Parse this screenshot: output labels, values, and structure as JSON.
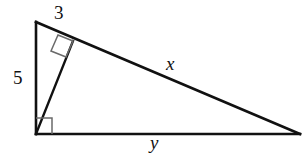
{
  "figure": {
    "background_color": "#ffffff",
    "stroke_color": "#111111",
    "marker_color": "#555555",
    "labels": {
      "short_leg": "3",
      "vertical_leg": "5",
      "hypotenuse": "x",
      "base": "y"
    },
    "vertices": {
      "apex": {
        "x": 36,
        "y": 22
      },
      "right_angle_corner": {
        "x": 36,
        "y": 134
      },
      "far_right": {
        "x": 300,
        "y": 134
      },
      "altitude_foot": {
        "x": 73,
        "y": 41
      }
    },
    "segments": [
      {
        "name": "vertical-leg",
        "label": "5",
        "from": "apex",
        "to": "right_angle_corner"
      },
      {
        "name": "base-leg",
        "label": "y",
        "from": "right_angle_corner",
        "to": "far_right"
      },
      {
        "name": "hypotenuse",
        "label": "x",
        "from": "apex",
        "to": "far_right"
      },
      {
        "name": "altitude",
        "label": "",
        "from": "right_angle_corner",
        "to": "altitude_foot"
      },
      {
        "name": "upper-hypotenuse-part",
        "label": "3",
        "from": "apex",
        "to": "altitude_foot"
      }
    ],
    "right_angle_markers": [
      {
        "name": "right-angle-marker-corner",
        "at": "right_angle_corner"
      },
      {
        "name": "right-angle-marker-altitude-foot",
        "at": "altitude_foot"
      }
    ]
  }
}
